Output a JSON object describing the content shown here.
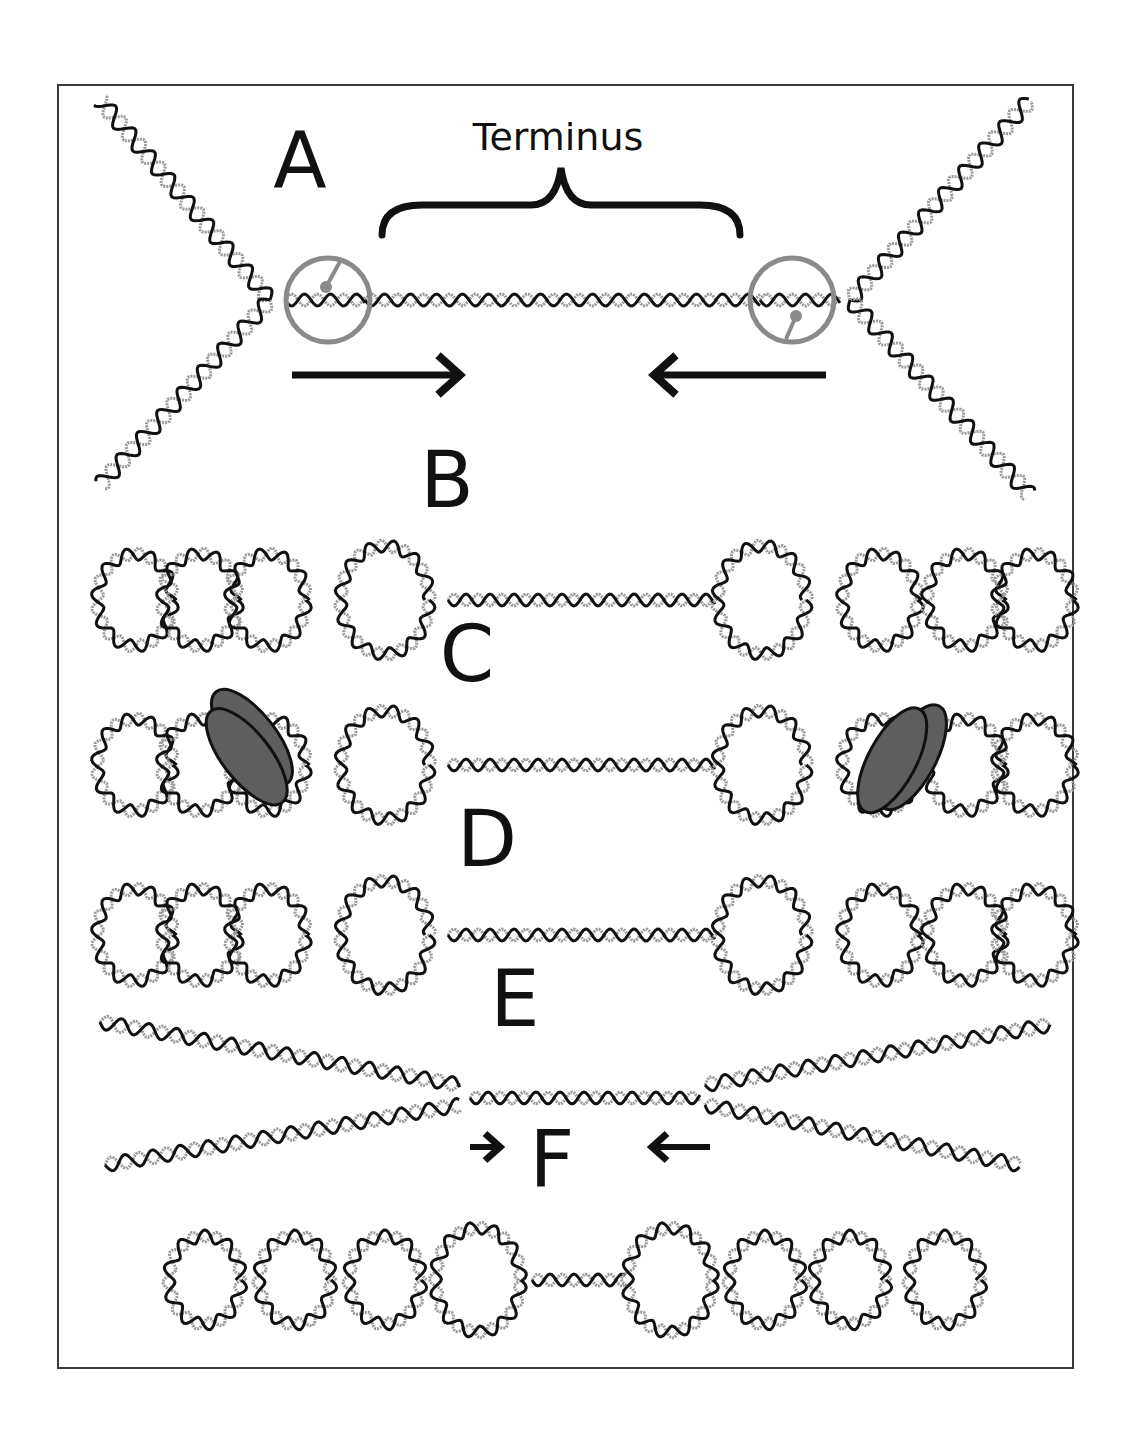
{
  "figure": {
    "title_label": "Terminus",
    "panels": [
      {
        "id": "A",
        "letter": "A",
        "description": "Two replication forks with replisomes converging at terminus"
      },
      {
        "id": "B",
        "letter": "B",
        "description": "Looped DNA domains flanking unwound terminus region"
      },
      {
        "id": "C",
        "letter": "C",
        "description": "Looped domains with protein complex bound on each side"
      },
      {
        "id": "D",
        "letter": "D",
        "description": "Looped domains flanking terminus region"
      },
      {
        "id": "E",
        "letter": "E",
        "description": "Crossing duplex arms with converging arrows"
      },
      {
        "id": "F",
        "letter": "F",
        "description": "Looped domains with shortened terminus segment"
      }
    ]
  },
  "colors": {
    "frame": "#3a3a3a",
    "strand_dark": "#111111",
    "strand_light": "#9a9a9a",
    "replisome_ring": "#8a8a8a",
    "protein_fill": "#5e5e5e",
    "text": "#111111"
  },
  "labels": {
    "terminus": {
      "text": "Terminus",
      "x": 558,
      "y": 138
    },
    "A": {
      "text": "A",
      "x": 300,
      "y": 162
    },
    "B": {
      "text": "B",
      "x": 447,
      "y": 481
    },
    "C": {
      "text": "C",
      "x": 467,
      "y": 655
    },
    "D": {
      "text": "D",
      "x": 487,
      "y": 840
    },
    "E": {
      "text": "E",
      "x": 515,
      "y": 1000
    },
    "F": {
      "text": "F",
      "x": 552,
      "y": 1160
    }
  },
  "arrows": [
    {
      "name": "fork-arrow-right",
      "x1": 292,
      "x2": 460,
      "y": 375,
      "dir": "right",
      "head": 22
    },
    {
      "name": "fork-arrow-left",
      "x1": 826,
      "x2": 654,
      "y": 375,
      "dir": "left",
      "head": 22
    },
    {
      "name": "converge-arrow-right",
      "x1": 470,
      "x2": 500,
      "y": 1147,
      "dir": "right",
      "head": 15
    },
    {
      "name": "converge-arrow-left",
      "x1": 710,
      "x2": 652,
      "y": 1147,
      "dir": "left",
      "head": 15
    }
  ],
  "brace": {
    "x1": 382,
    "x2": 740,
    "y": 205,
    "tip_y": 168
  },
  "replisomes": [
    {
      "name": "replisome-left",
      "cx": 328,
      "cy": 300,
      "r": 42,
      "stem": [
        [
          326,
          287
        ],
        [
          342,
          258
        ]
      ]
    },
    {
      "name": "replisome-right",
      "cx": 792,
      "cy": 300,
      "r": 42,
      "stem": [
        [
          796,
          316
        ],
        [
          786,
          339
        ]
      ]
    }
  ],
  "rows": [
    {
      "name": "row-b",
      "y": 600,
      "loops_left": [
        135,
        200,
        268,
        385
      ],
      "loops_right": [
        762,
        880,
        965,
        1035
      ],
      "terminus": [
        448,
        715
      ]
    },
    {
      "name": "row-c",
      "y": 765,
      "loops_left": [
        135,
        200,
        268,
        385
      ],
      "loops_right": [
        762,
        880,
        965,
        1035
      ],
      "terminus": [
        448,
        715
      ]
    },
    {
      "name": "row-d",
      "y": 935,
      "loops_left": [
        135,
        200,
        268,
        385
      ],
      "loops_right": [
        762,
        880,
        965,
        1035
      ],
      "terminus": [
        448,
        715
      ]
    },
    {
      "name": "row-f",
      "y": 1280,
      "loops_left": [
        205,
        295,
        385,
        478
      ],
      "loops_right": [
        670,
        765,
        850,
        945
      ],
      "terminus": [
        532,
        625
      ]
    }
  ],
  "proteins": [
    {
      "name": "protein-complex-left",
      "cx": 243,
      "cy": 752,
      "rx": 24,
      "ry": 58,
      "angle": -38
    },
    {
      "name": "protein-complex-right",
      "cx": 895,
      "cy": 755,
      "rx": 24,
      "ry": 58,
      "angle": 28
    }
  ]
}
